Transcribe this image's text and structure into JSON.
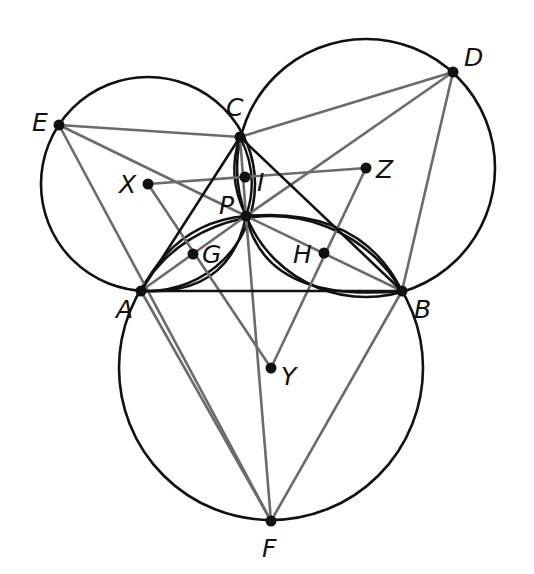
{
  "figure": {
    "type": "geometry-diagram",
    "colors": {
      "primary": "#111111",
      "secondary": "#6b6b6b",
      "background": "#ffffff"
    },
    "points": {
      "A": {
        "label": "A",
        "x": 141,
        "y": 291
      },
      "B": {
        "label": "B",
        "x": 402,
        "y": 291
      },
      "C": {
        "label": "C",
        "x": 240,
        "y": 137
      },
      "D": {
        "label": "D",
        "x": 453,
        "y": 72
      },
      "E": {
        "label": "E",
        "x": 59,
        "y": 125
      },
      "F": {
        "label": "F",
        "x": 271,
        "y": 521
      },
      "G": {
        "label": "G",
        "x": 193,
        "y": 254
      },
      "H": {
        "label": "H",
        "x": 324,
        "y": 253
      },
      "I": {
        "label": "I",
        "x": 245,
        "y": 177
      },
      "P": {
        "label": "P",
        "x": 246,
        "y": 216
      },
      "X": {
        "label": "X",
        "x": 148,
        "y": 184
      },
      "Y": {
        "label": "Y",
        "x": 271,
        "y": 368
      },
      "Z": {
        "label": "Z",
        "x": 366,
        "y": 168
      }
    },
    "circles": [
      {
        "center": "X",
        "r": 107
      },
      {
        "center": "Y",
        "r": 152
      },
      {
        "center": "Z",
        "r": 129
      }
    ],
    "black_segments": [
      [
        "A",
        "B"
      ],
      [
        "B",
        "C"
      ],
      [
        "C",
        "A"
      ]
    ],
    "gray_segments": [
      [
        "E",
        "C"
      ],
      [
        "E",
        "P"
      ],
      [
        "E",
        "F"
      ],
      [
        "D",
        "C"
      ],
      [
        "D",
        "P"
      ],
      [
        "D",
        "B"
      ],
      [
        "F",
        "A"
      ],
      [
        "F",
        "B"
      ],
      [
        "F",
        "P"
      ],
      [
        "A",
        "P"
      ],
      [
        "B",
        "P"
      ],
      [
        "C",
        "P"
      ],
      [
        "X",
        "Z"
      ],
      [
        "X",
        "Y"
      ],
      [
        "Z",
        "Y"
      ]
    ]
  }
}
